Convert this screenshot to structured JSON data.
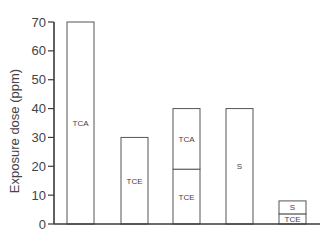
{
  "chart_data": {
    "type": "bar",
    "stacked": true,
    "title": "",
    "xlabel": "",
    "ylabel": "Exposure dose (ppm)",
    "ylim": [
      0,
      70
    ],
    "yticks": [
      0,
      10,
      20,
      30,
      40,
      50,
      60,
      70
    ],
    "grid": false,
    "legend": "none",
    "bars": [
      {
        "segments": [
          {
            "label": "TCA",
            "value": 70
          }
        ]
      },
      {
        "segments": [
          {
            "label": "TCE",
            "value": 30
          }
        ]
      },
      {
        "segments": [
          {
            "label": "TCE",
            "value": 19
          },
          {
            "label": "TCA",
            "value": 21
          }
        ]
      },
      {
        "segments": [
          {
            "label": "S",
            "value": 40
          }
        ]
      },
      {
        "segments": [
          {
            "label": "TCE",
            "value": 3.5
          },
          {
            "label": "S",
            "value": 4.5
          }
        ]
      }
    ]
  }
}
